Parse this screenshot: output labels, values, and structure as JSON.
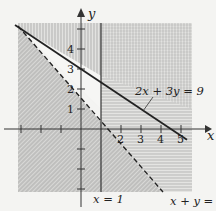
{
  "diagram": {
    "type": "inequality-graph",
    "axes": {
      "x_label": "x",
      "y_label": "y",
      "x_ticks": [
        {
          "value": 2,
          "label": "2"
        },
        {
          "value": 3,
          "label": "3"
        },
        {
          "value": 4,
          "label": "4"
        },
        {
          "value": 5,
          "label": "5"
        }
      ],
      "y_ticks": [
        {
          "value": 1,
          "label": "1"
        },
        {
          "value": 2,
          "label": "2"
        },
        {
          "value": 3,
          "label": "3"
        },
        {
          "value": 4,
          "label": "4"
        }
      ]
    },
    "lines": [
      {
        "equation": "2x + 3y = 9",
        "style": "solid"
      },
      {
        "equation": "x + y = 2",
        "style": "dashed"
      },
      {
        "equation": "x = 1",
        "style": "solid"
      }
    ],
    "shading": [
      {
        "region": "x ≥ 1",
        "pattern": "vertical-lines"
      },
      {
        "region": "2x + 3y ≤ 9 (below solid line)",
        "pattern": "horizontal-lines"
      },
      {
        "region": "x + y < 2 (below dashed line)",
        "pattern": "diagonal-lines"
      }
    ],
    "colors": {
      "background": "#f4f4f2",
      "ink": "#222222",
      "hatch": "#9a9a9a"
    }
  }
}
